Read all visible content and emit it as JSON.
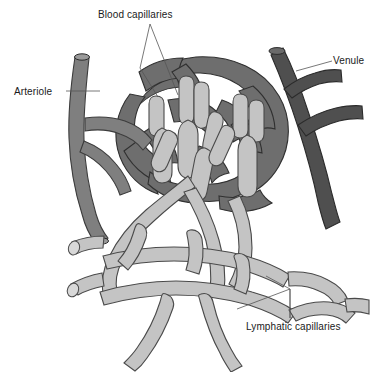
{
  "figure": {
    "background_color": "#ffffff",
    "width": 386,
    "height": 372
  },
  "labels": {
    "blood_capillaries": "Blood capillaries",
    "arteriole": "Arteriole",
    "venule": "Venule",
    "lymphatic_capillaries": "Lymphatic capillaries"
  },
  "colors": {
    "arteriole": "#7f7f7f",
    "venule": "#4f4f4f",
    "blood_capillary_bed": "#6e6e6e",
    "lymphatic": "#c4c4c4",
    "outline": "#3c3c3c",
    "leader_line": "#555555",
    "text": "#1a1a1a",
    "background": "#ffffff"
  },
  "structures": [
    {
      "name": "arteriole",
      "shade": "medium-gray",
      "side": "left",
      "cut_ends": 2
    },
    {
      "name": "venule",
      "shade": "dark-gray",
      "side": "right",
      "cut_ends": 1
    },
    {
      "name": "blood-capillary-bed",
      "shade": "medium-dark-gray",
      "position": "center-upper"
    },
    {
      "name": "lymphatic-capillary-network",
      "shade": "light-gray",
      "position": "center-lower",
      "blind_ended_projections": true
    }
  ]
}
